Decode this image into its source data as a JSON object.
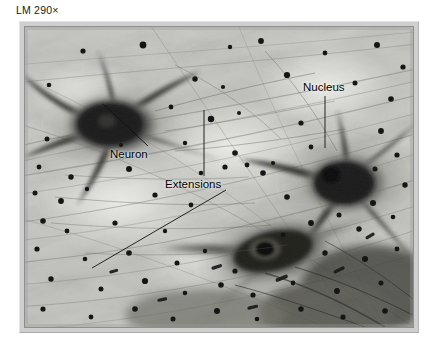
{
  "figure": {
    "magnification_caption": "LM 290×"
  },
  "annotations": [
    {
      "id": "neuron",
      "label": "Neuron",
      "leader": "diagonal-up-left-to-cell-body"
    },
    {
      "id": "extensions",
      "label": "Extensions",
      "leader": "vertical-up-and-diagonal-down-left"
    },
    {
      "id": "nucleus",
      "label": "Nucleus",
      "leader": "vertical-down-into-cell-body"
    }
  ],
  "colors": {
    "page_background": "#ffffff",
    "frame_mount": "#cfcfcf",
    "frame_border": "#8e8e8e",
    "plate_base": "#bdbdb8",
    "cell_dark": "#2a2a2a",
    "speck_dark": "#151515",
    "label_text": "#000000",
    "leader_line": "#111111"
  }
}
